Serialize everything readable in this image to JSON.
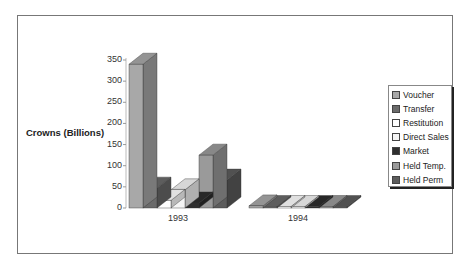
{
  "chart_data": {
    "type": "bar",
    "title": "",
    "xlabel": "",
    "ylabel": "Crowns (Billions)",
    "ylim": [
      0,
      350
    ],
    "yticks": [
      "0",
      "50",
      "100",
      "150",
      "200",
      "250",
      "300",
      "350"
    ],
    "categories": [
      "1993",
      "1994"
    ],
    "series": [
      {
        "name": "Voucher",
        "values": [
          340,
          5
        ],
        "color": "#a8a8a8"
      },
      {
        "name": "Transfer",
        "values": [
          47,
          0
        ],
        "color": "#6a6a6a"
      },
      {
        "name": "Restitution",
        "values": [
          18,
          0
        ],
        "color": "#ffffff"
      },
      {
        "name": "Direct  Sales",
        "values": [
          43,
          0
        ],
        "color": "#f4f4f4"
      },
      {
        "name": "Market",
        "values": [
          12,
          0
        ],
        "color": "#2e2e2e"
      },
      {
        "name": "Held Temp.",
        "values": [
          125,
          0
        ],
        "color": "#9a9a9a"
      },
      {
        "name": "Held Perm",
        "values": [
          66,
          0
        ],
        "color": "#5c5c5c"
      }
    ],
    "grid": false,
    "legend_position": "right",
    "style": "3d"
  }
}
